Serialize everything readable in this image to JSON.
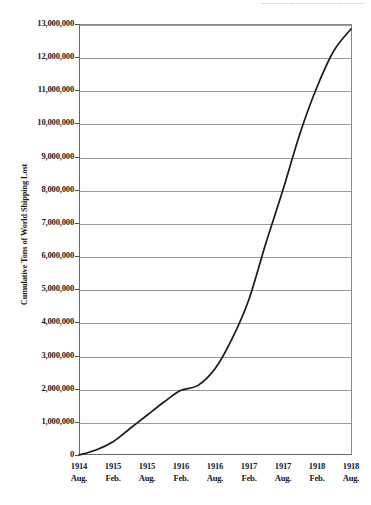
{
  "header": {
    "cropped_title": "———————————————"
  },
  "chart_data": {
    "type": "line",
    "title": "",
    "xlabel": "",
    "ylabel": "Cumulative Tons of World Shipping Lost",
    "ylim": [
      0,
      13000000
    ],
    "grid": true,
    "legend": false,
    "line_color": "#1a1a1a",
    "categories": [
      "1914 Aug.",
      "1915 Feb.",
      "1915 Aug.",
      "1916 Feb.",
      "1916 Aug.",
      "1917 Feb.",
      "1917 Aug.",
      "1918 Feb.",
      "1918 Aug."
    ],
    "xtick_labels": [
      {
        "year": "1914",
        "month": "Aug."
      },
      {
        "year": "1915",
        "month": "Feb."
      },
      {
        "year": "1915",
        "month": "Aug."
      },
      {
        "year": "1916",
        "month": "Feb."
      },
      {
        "year": "1916",
        "month": "Aug."
      },
      {
        "year": "1917",
        "month": "Feb."
      },
      {
        "year": "1917",
        "month": "Aug."
      },
      {
        "year": "1918",
        "month": "Feb."
      },
      {
        "year": "1918",
        "month": "Aug."
      }
    ],
    "ytick_labels": [
      "13,000,000",
      "12,000,000",
      "11,000,000",
      "10,000,000",
      "9,000,000",
      "8,000,000",
      "7,000,000",
      "6,000,000",
      "5,000,000",
      "4,000,000",
      "3,000,000",
      "2,000,000",
      "1,000,000",
      "0"
    ],
    "ytick_values": [
      13000000,
      12000000,
      11000000,
      10000000,
      9000000,
      8000000,
      7000000,
      6000000,
      5000000,
      4000000,
      3000000,
      2000000,
      1000000,
      0
    ],
    "series": [
      {
        "name": "Cumulative Tons of World Shipping Lost",
        "x": [
          "1914 Aug.",
          "1914 Nov.",
          "1915 Feb.",
          "1915 May",
          "1915 Aug.",
          "1915 Nov.",
          "1916 Feb.",
          "1916 May",
          "1916 Aug.",
          "1916 Nov.",
          "1917 Feb.",
          "1917 May",
          "1917 Aug.",
          "1917 Nov.",
          "1918 Feb.",
          "1918 May",
          "1918 Aug."
        ],
        "values": [
          0,
          150000,
          400000,
          800000,
          1200000,
          1600000,
          1950000,
          2100000,
          2600000,
          3500000,
          4700000,
          6400000,
          8000000,
          9700000,
          11100000,
          12200000,
          12850000
        ]
      }
    ]
  }
}
